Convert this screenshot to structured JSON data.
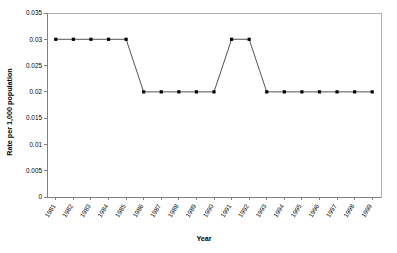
{
  "chart_data": {
    "type": "line",
    "title": "",
    "xlabel": "Year",
    "ylabel": "Rate per 1,000 population",
    "categories": [
      "1981",
      "1982",
      "1983",
      "1984",
      "1985",
      "1986",
      "1987",
      "1988",
      "1989",
      "1990",
      "1991",
      "1992",
      "1993",
      "1994",
      "1995",
      "1996",
      "1997",
      "1998",
      "1999"
    ],
    "values": [
      0.03,
      0.03,
      0.03,
      0.03,
      0.03,
      0.02,
      0.02,
      0.02,
      0.02,
      0.02,
      0.03,
      0.03,
      0.02,
      0.02,
      0.02,
      0.02,
      0.02,
      0.02,
      0.02
    ],
    "series": [
      {
        "name": "Rate",
        "values": [
          0.03,
          0.03,
          0.03,
          0.03,
          0.03,
          0.02,
          0.02,
          0.02,
          0.02,
          0.02,
          0.03,
          0.03,
          0.02,
          0.02,
          0.02,
          0.02,
          0.02,
          0.02,
          0.02
        ]
      }
    ],
    "ylim": [
      0,
      0.035
    ],
    "yticks": [
      0,
      0.005,
      0.01,
      0.015,
      0.02,
      0.025,
      0.03,
      0.035
    ],
    "ytick_labels": [
      "0",
      "0.005",
      "0.01",
      "0.015",
      "0.02",
      "0.025",
      "0.03",
      "0.035"
    ],
    "grid": false,
    "legend": false,
    "marker": "square",
    "line_color": "#404040",
    "marker_color": "#000000",
    "plot_background": "#ffffff"
  }
}
